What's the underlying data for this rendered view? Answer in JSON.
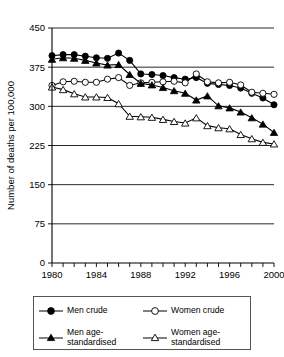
{
  "chart_data": {
    "type": "line",
    "title": "",
    "xlabel": "Year",
    "ylabel": "Number of deaths per 100,000",
    "xlim": [
      1980,
      2000
    ],
    "ylim": [
      0,
      450
    ],
    "yticks": [
      0,
      75,
      150,
      225,
      300,
      375,
      450
    ],
    "ytick_labels": [
      "0",
      "75",
      "150",
      "225",
      "300",
      "375",
      "450"
    ],
    "xticks": [
      1980,
      1981,
      1982,
      1983,
      1984,
      1985,
      1986,
      1987,
      1988,
      1989,
      1990,
      1991,
      1992,
      1993,
      1994,
      1995,
      1996,
      1997,
      1998,
      1999,
      2000
    ],
    "xtick_labels_shown": [
      "1980",
      "1984",
      "1988",
      "1992",
      "1996",
      "2000"
    ],
    "grid": "horizontal",
    "legend_position": "below-plot",
    "x": [
      1980,
      1981,
      1982,
      1983,
      1984,
      1985,
      1986,
      1987,
      1988,
      1989,
      1990,
      1991,
      1992,
      1993,
      1994,
      1995,
      1996,
      1997,
      1998,
      1999,
      2000
    ],
    "series": [
      {
        "name": "Men crude",
        "marker": "filled-circle",
        "values": [
          397,
          399,
          399,
          396,
          393,
          392,
          402,
          388,
          362,
          361,
          359,
          355,
          352,
          355,
          344,
          342,
          340,
          335,
          325,
          316,
          303
        ]
      },
      {
        "name": "Women crude",
        "marker": "open-circle",
        "values": [
          340,
          347,
          348,
          346,
          346,
          352,
          355,
          340,
          345,
          346,
          347,
          348,
          345,
          362,
          347,
          345,
          346,
          341,
          327,
          325,
          323
        ]
      },
      {
        "name": "Men age-standardised",
        "marker": "filled-triangle",
        "values": [
          390,
          393,
          392,
          388,
          383,
          379,
          380,
          361,
          344,
          341,
          336,
          330,
          325,
          312,
          320,
          301,
          297,
          289,
          278,
          266,
          250
        ]
      },
      {
        "name": "Women age-standardised",
        "marker": "open-triangle",
        "values": [
          337,
          332,
          324,
          318,
          318,
          317,
          305,
          281,
          280,
          279,
          275,
          271,
          268,
          278,
          263,
          259,
          257,
          246,
          238,
          231,
          228
        ]
      }
    ],
    "legend": [
      {
        "label": "Men crude",
        "marker": "filled-circle"
      },
      {
        "label": "Women crude",
        "marker": "open-circle"
      },
      {
        "label": "Men age-standardised",
        "marker": "filled-triangle"
      },
      {
        "label": "Women age-standardised",
        "marker": "open-triangle"
      }
    ],
    "colors": {
      "ink": "#000000",
      "background": "#ffffff",
      "grid": "#000000"
    }
  }
}
